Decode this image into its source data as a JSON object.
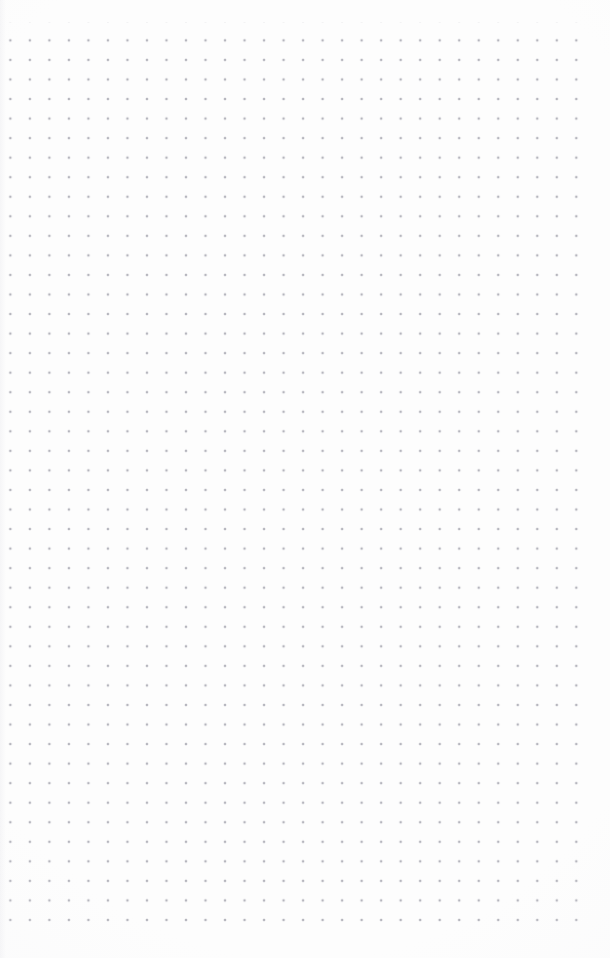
{
  "page": {
    "title": "Dot Grid Paper",
    "width_px": 610,
    "height_px": 958,
    "background_color": "#fdfdfd",
    "content_description": "Blank dot grid (bullet journal) page with no text or UI controls"
  },
  "grid": {
    "dot_color": "#b5b5bd",
    "dot_diameter_px": 1.6,
    "spacing_x_px": 19.53,
    "spacing_y_px": 19.56,
    "origin_x_px": 0.6,
    "origin_y_px": 30.6,
    "columns": 30,
    "rows": 46,
    "first_column_x_px": 1,
    "last_column_x_px": 577,
    "first_row_y_px": 31,
    "last_row_y_px": 921,
    "margin_top_px": 31,
    "margin_bottom_px": 37,
    "margin_left_px": 1,
    "margin_right_px": 33
  }
}
